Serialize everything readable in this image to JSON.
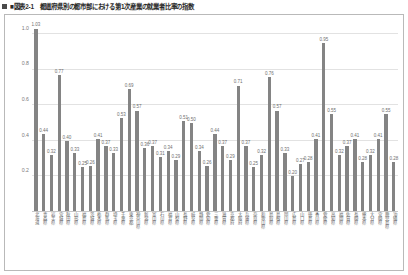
{
  "title": {
    "marker": "square-bullet",
    "text": "■図表2-1　都道府県別の都市部における第1次産業の就業者比率の指数"
  },
  "chart_data": {
    "type": "bar",
    "title": "■図表2-1　都道府県別の都市部における第1次産業の就業者比率の指数",
    "xlabel": "",
    "ylabel": "",
    "ylim": [
      0.0,
      1.05
    ],
    "yticks": [
      "0.2",
      "0.4",
      "0.6",
      "0.8",
      "1.0"
    ],
    "ytick_values": [
      0.2,
      0.4,
      0.6,
      0.8,
      1.0
    ],
    "grid": true,
    "legend": "none",
    "bar_color": "#848484",
    "show_value_labels": true,
    "categories": [
      "北海道",
      "青森県",
      "岩手県",
      "宮城県",
      "秋田県",
      "山形県",
      "福島県",
      "茨城県",
      "栃木県",
      "群馬県",
      "埼玉県",
      "千葉県",
      "東京都",
      "神奈川県",
      "新潟県",
      "富山県",
      "石川県",
      "福井県",
      "山梨県",
      "長野県",
      "岐阜県",
      "静岡県",
      "愛知県",
      "三重県",
      "滋賀県",
      "京都府",
      "大阪府",
      "兵庫県",
      "奈良県",
      "和歌山県",
      "鳥取県",
      "島根県",
      "岡山県",
      "広島県",
      "山口県",
      "徳島県",
      "香川県",
      "愛媛県",
      "高知県",
      "福岡県",
      "佐賀県",
      "長崎県",
      "熊本県",
      "大分県",
      "宮崎県",
      "鹿児島県",
      "沖縄県"
    ],
    "values": [
      1.03,
      0.44,
      0.32,
      0.77,
      0.4,
      0.33,
      0.25,
      0.26,
      0.41,
      0.37,
      0.33,
      0.53,
      0.69,
      0.57,
      0.36,
      0.37,
      0.31,
      0.34,
      0.29,
      0.51,
      0.5,
      0.34,
      0.26,
      0.44,
      0.37,
      0.29,
      0.71,
      0.37,
      0.25,
      0.32,
      0.76,
      0.57,
      0.33,
      0.2,
      0.27,
      0.28,
      0.41,
      0.95,
      0.55,
      0.32,
      0.37,
      0.41,
      0.28,
      0.32,
      0.41,
      0.55,
      0.28
    ],
    "value_labels": [
      "1.03",
      "0.44",
      "0.32",
      "0.77",
      "0.40",
      "0.33",
      "0.25",
      "0.26",
      "0.41",
      "0.37",
      "0.33",
      "0.53",
      "0.69",
      "0.57",
      "0.36",
      "0.37",
      "0.31",
      "0.34",
      "0.29",
      "0.51",
      "0.50",
      "0.34",
      "0.26",
      "0.44",
      "0.37",
      "0.29",
      "0.71",
      "0.37",
      "0.25",
      "0.32",
      "0.76",
      "0.57",
      "0.33",
      "0.20",
      "0.27",
      "0.28",
      "0.41",
      "0.95",
      "0.55",
      "0.32",
      "0.37",
      "0.41",
      "0.28",
      "0.32",
      "0.41",
      "0.55",
      "0.28"
    ]
  }
}
